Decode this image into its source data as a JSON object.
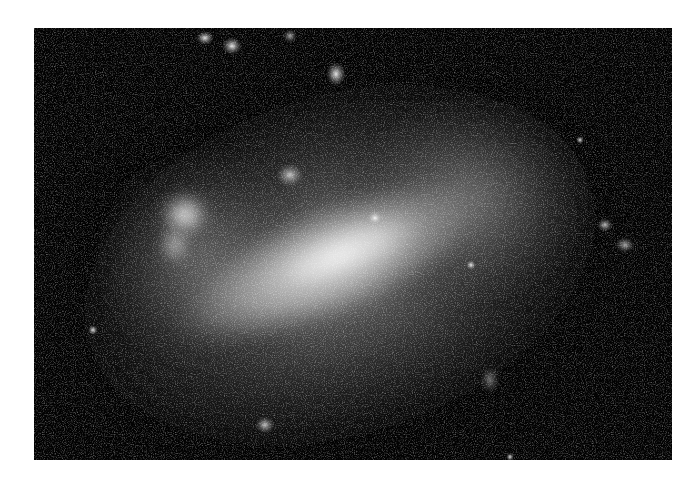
{
  "image": {
    "subject": "irregular barred galaxy (Large Magellanic Cloud)",
    "style": "grayscale astronomical photograph",
    "background_color": "#ffffff",
    "sky_color": "#020202",
    "frame": {
      "left": 34,
      "top": 28,
      "width": 638,
      "height": 432
    },
    "features": [
      {
        "name": "central-bar",
        "cx": 330,
        "cy": 260,
        "rx": 170,
        "ry": 62,
        "angle": -22,
        "brightness": 0.9
      },
      {
        "name": "tarantula-nebula-region",
        "cx": 185,
        "cy": 225,
        "r": 35
      },
      {
        "name": "northern-nebulae",
        "points": [
          [
            205,
            40
          ],
          [
            232,
            47
          ],
          [
            290,
            37
          ],
          [
            335,
            75
          ]
        ]
      },
      {
        "name": "eastern-star-field",
        "cx": 480,
        "cy": 190,
        "r": 80
      },
      {
        "name": "southern-cluster",
        "cx": 265,
        "cy": 425,
        "r": 14
      }
    ]
  }
}
